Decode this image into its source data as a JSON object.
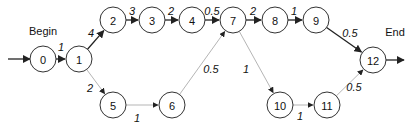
{
  "diagram": {
    "type": "activity-network",
    "labels": {
      "begin": "Begin",
      "end": "End"
    },
    "colors": {
      "critical_edge": "#222222",
      "other_edge": "#b5b5b5",
      "node_stroke": "#333333"
    },
    "node_radius": 13,
    "nodes": [
      {
        "id": "0",
        "label": "0",
        "x": 43,
        "y": 59
      },
      {
        "id": "1",
        "label": "1",
        "x": 79,
        "y": 59
      },
      {
        "id": "2",
        "label": "2",
        "x": 113,
        "y": 20
      },
      {
        "id": "3",
        "label": "3",
        "x": 152,
        "y": 20
      },
      {
        "id": "4",
        "label": "4",
        "x": 192,
        "y": 20
      },
      {
        "id": "7",
        "label": "7",
        "x": 233,
        "y": 20
      },
      {
        "id": "8",
        "label": "8",
        "x": 275,
        "y": 20
      },
      {
        "id": "9",
        "label": "9",
        "x": 316,
        "y": 20
      },
      {
        "id": "12",
        "label": "12",
        "x": 373,
        "y": 60
      },
      {
        "id": "5",
        "label": "5",
        "x": 113,
        "y": 105
      },
      {
        "id": "6",
        "label": "6",
        "x": 172,
        "y": 105
      },
      {
        "id": "10",
        "label": "10",
        "x": 280,
        "y": 105
      },
      {
        "id": "11",
        "label": "11",
        "x": 327,
        "y": 105
      }
    ],
    "edges": [
      {
        "from": "0",
        "to": "1",
        "weight": "1",
        "style": "dark",
        "lx": 61,
        "ly": 47
      },
      {
        "from": "1",
        "to": "2",
        "weight": "4",
        "style": "dark",
        "lx": 91,
        "ly": 33
      },
      {
        "from": "2",
        "to": "3",
        "weight": "3",
        "style": "dark",
        "lx": 132,
        "ly": 11
      },
      {
        "from": "3",
        "to": "4",
        "weight": "2",
        "style": "dark",
        "lx": 171,
        "ly": 11
      },
      {
        "from": "4",
        "to": "7",
        "weight": "0.5",
        "style": "dark",
        "lx": 212,
        "ly": 11
      },
      {
        "from": "7",
        "to": "8",
        "weight": "2",
        "style": "dark",
        "lx": 253,
        "ly": 11
      },
      {
        "from": "8",
        "to": "9",
        "weight": "1",
        "style": "dark",
        "lx": 294,
        "ly": 11
      },
      {
        "from": "9",
        "to": "12",
        "weight": "0.5",
        "style": "dark",
        "lx": 350,
        "ly": 33
      },
      {
        "from": "1",
        "to": "5",
        "weight": "2",
        "style": "light",
        "lx": 90,
        "ly": 88
      },
      {
        "from": "5",
        "to": "6",
        "weight": "1",
        "style": "light",
        "lx": 137,
        "ly": 118
      },
      {
        "from": "6",
        "to": "7",
        "weight": "0.5",
        "style": "light",
        "lx": 211,
        "ly": 69
      },
      {
        "from": "7",
        "to": "10",
        "weight": "1",
        "style": "light",
        "lx": 246,
        "ly": 69
      },
      {
        "from": "10",
        "to": "11",
        "weight": "1",
        "style": "light",
        "lx": 300,
        "ly": 116
      },
      {
        "from": "11",
        "to": "12",
        "weight": "0.5",
        "style": "light",
        "lx": 354,
        "ly": 87
      }
    ],
    "entry_arrow": {
      "x1": 8,
      "y1": 59,
      "x2": 30,
      "y2": 59
    },
    "exit_arrow": {
      "x1": 386,
      "y1": 60,
      "x2": 404,
      "y2": 60
    },
    "begin_label_pos": {
      "x": 43,
      "y": 31
    },
    "end_label_pos": {
      "x": 395,
      "y": 32
    }
  }
}
